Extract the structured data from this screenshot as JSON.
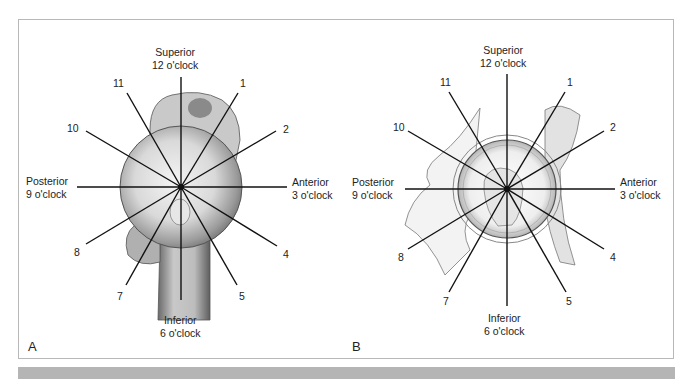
{
  "figure": {
    "panels": [
      {
        "id": "A",
        "letter": "A",
        "subject": "humeral head (clock face overlay)",
        "center": [
          181,
          187
        ],
        "labels": {
          "superior": "Superior",
          "superior_clock": "12 o'clock",
          "inferior": "Inferior",
          "inferior_clock": "6 o'clock",
          "posterior": "Posterior",
          "posterior_clock": "9 o'clock",
          "anterior": "Anterior",
          "anterior_clock": "3 o'clock"
        },
        "hours": [
          "1",
          "2",
          "4",
          "5",
          "7",
          "8",
          "10",
          "11"
        ]
      },
      {
        "id": "B",
        "letter": "B",
        "subject": "glenoid / acetabular socket (clock face overlay)",
        "center": [
          507,
          189
        ],
        "labels": {
          "superior": "Superior",
          "superior_clock": "12 o'clock",
          "inferior": "Inferior",
          "inferior_clock": "6 o'clock",
          "posterior": "Posterior",
          "posterior_clock": "9 o'clock",
          "anterior": "Anterior",
          "anterior_clock": "3 o'clock"
        },
        "hours": [
          "1",
          "2",
          "4",
          "5",
          "7",
          "8",
          "10",
          "11"
        ]
      }
    ],
    "colors": {
      "line": "#111111",
      "border": "#b8b8b8",
      "bottom_bar": "#b5b5b5",
      "bone_shade": "#8a8a8a"
    }
  }
}
